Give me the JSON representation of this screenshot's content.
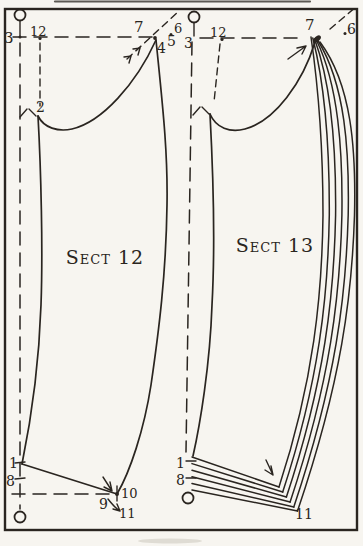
{
  "figure": {
    "type": "tailoring-pattern-drafting-diagram",
    "colors": {
      "paper": "#f7f5f0",
      "ink": "#2a2520"
    },
    "sect12": {
      "title": "Sect 12",
      "point_labels": {
        "p1": "1",
        "p2": "2",
        "p3": "3",
        "p4": "4",
        "p5": "5",
        "p6": "6",
        "p7": "7",
        "p8": "8",
        "p9": "9",
        "p10": "10",
        "p11": "11",
        "p12": "12"
      }
    },
    "sect13": {
      "title": "Sect 13",
      "point_labels": {
        "p1": "1",
        "p3": "3",
        "p6": "6",
        "p7": "7",
        "p8": "8",
        "p11": "11",
        "p12": "12"
      }
    }
  }
}
